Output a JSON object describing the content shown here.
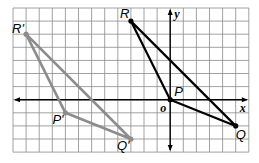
{
  "diagram": {
    "type": "coordinate-grid-translation",
    "grid": {
      "left_px": 13,
      "top_px": 8,
      "cell_px": 13.1,
      "cols": 18,
      "rows": 11,
      "origin_col": 12,
      "origin_row": 7,
      "line_color": "#8a8a8a",
      "border_color": "#8a8a8a"
    },
    "axes": {
      "x_label": "x",
      "y_label": "y",
      "origin_label": "o",
      "color": "#000000"
    },
    "original_triangle": {
      "color": "#000000",
      "vertices": [
        {
          "name": "R",
          "label": "R",
          "x": -3,
          "y": 6
        },
        {
          "name": "P",
          "label": "P",
          "x": 0,
          "y": 0
        },
        {
          "name": "Q",
          "label": "Q",
          "x": 5,
          "y": -2
        }
      ]
    },
    "image_triangle": {
      "color": "#8c8c8c",
      "vertices": [
        {
          "name": "R'",
          "label": "R'",
          "x": -11,
          "y": 5
        },
        {
          "name": "P'",
          "label": "P'",
          "x": -8,
          "y": -1
        },
        {
          "name": "Q'",
          "label": "Q'",
          "x": -3,
          "y": -3
        }
      ]
    }
  }
}
